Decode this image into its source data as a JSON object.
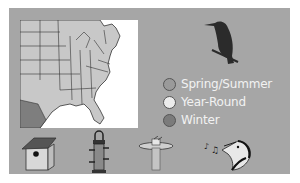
{
  "legend": {
    "items": [
      {
        "label": "Spring/Summer",
        "color": "#9a9a9a"
      },
      {
        "label": "Year-Round",
        "color": "#ececec"
      },
      {
        "label": "Winter",
        "color": "#7b7b7b"
      }
    ]
  },
  "colors": {
    "panel": "#a6a6a6",
    "map_land": "#c8c8c8",
    "map_border": "#333333",
    "map_shaded": "#7e7e7e"
  },
  "icons": [
    "birdhouse-icon",
    "tube-feeder-icon",
    "birdbath-icon",
    "singing-bird-icon"
  ]
}
